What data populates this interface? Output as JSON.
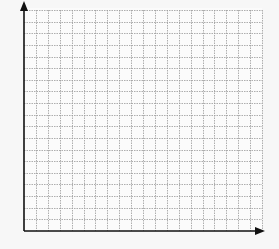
{
  "diagram": {
    "type": "blank-coordinate-grid",
    "axes": {
      "x_axis": {
        "has_arrow": true,
        "label": ""
      },
      "y_axis": {
        "has_arrow": true,
        "label": ""
      }
    },
    "grid": {
      "columns": 20,
      "rows": 19,
      "line_style": "dotted",
      "line_color": "#9a9a9a",
      "axis_color": "#111111",
      "background": "#fbfbfb"
    }
  }
}
